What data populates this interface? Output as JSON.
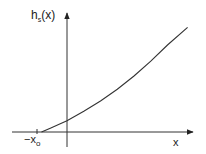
{
  "chart_data": {
    "type": "line",
    "title": "",
    "xlabel": "x",
    "ylabel": "h_s(x)",
    "ylabel_main": "h",
    "ylabel_sub": "s",
    "ylabel_tail": "(x)",
    "xtick_label_main": "−x",
    "xtick_label_sub": "o",
    "xlim": [
      -1.0,
      4.0
    ],
    "ylim": [
      0,
      4.0
    ],
    "grid": false,
    "legend": "none",
    "series": [
      {
        "name": "h_s(x)",
        "x0": -0.76,
        "description": "convex increasing curve starting at -x_o on the x-axis",
        "points": [
          [
            -0.76,
            0.0
          ],
          [
            -0.5,
            0.13
          ],
          [
            -0.25,
            0.25
          ],
          [
            0.0,
            0.38
          ],
          [
            0.5,
            0.7
          ],
          [
            1.0,
            1.05
          ],
          [
            1.5,
            1.45
          ],
          [
            2.0,
            1.9
          ],
          [
            2.5,
            2.4
          ],
          [
            3.0,
            2.95
          ],
          [
            3.6,
            3.55
          ]
        ]
      }
    ]
  }
}
